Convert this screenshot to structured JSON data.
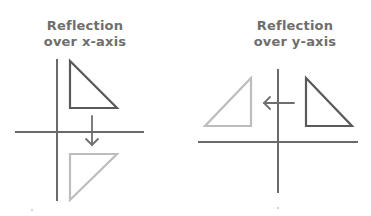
{
  "diagrams": [
    {
      "title_line1": "Reflection",
      "title_line2": "over x-axis",
      "original_color": "#5a5a5a",
      "reflected_color": "#bdbdbd",
      "axis_color": "#6a6a6a"
    },
    {
      "title_line1": "Reflection",
      "title_line2": "over y-axis",
      "original_color": "#5a5a5a",
      "reflected_color": "#bdbdbd",
      "axis_color": "#6a6a6a"
    }
  ]
}
